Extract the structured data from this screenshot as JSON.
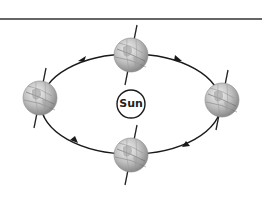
{
  "diagram": {
    "sun": {
      "label": "Sun"
    },
    "earth_positions": [
      {
        "name": "top",
        "cx": 131,
        "cy": 55
      },
      {
        "name": "left",
        "cx": 40,
        "cy": 98
      },
      {
        "name": "right",
        "cx": 222,
        "cy": 100
      },
      {
        "name": "bottom",
        "cx": 131,
        "cy": 155
      }
    ],
    "orbit_direction": "counter-clockwise",
    "colors": {
      "line": "#1a1a1a",
      "globe": "#b8b8b8",
      "background": "#ffffff"
    }
  }
}
